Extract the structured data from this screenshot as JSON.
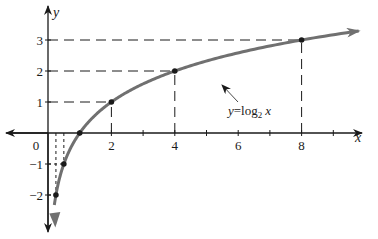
{
  "chart_data": {
    "type": "line",
    "title": "",
    "xlabel": "x",
    "ylabel": "y",
    "function": "y = log2 x",
    "annotation": {
      "text_y": "y",
      "text_eq": "=log",
      "text_sub": "2",
      "text_x": "x"
    },
    "x_ticks": [
      1,
      2,
      3,
      4,
      5,
      6,
      7,
      8,
      9
    ],
    "x_tick_labels": [
      "0",
      "2",
      "4",
      "6",
      "8"
    ],
    "y_tick_labels": [
      "3",
      "2",
      "1",
      "−1",
      "−2"
    ],
    "xlim": [
      -1.5,
      9.8
    ],
    "ylim": [
      -2.8,
      3.3
    ],
    "grid": false,
    "marked_points": [
      {
        "x": 0.25,
        "y": -2
      },
      {
        "x": 0.5,
        "y": -1
      },
      {
        "x": 1,
        "y": 0
      },
      {
        "x": 2,
        "y": 1
      },
      {
        "x": 4,
        "y": 2
      },
      {
        "x": 8,
        "y": 3
      }
    ],
    "series": [
      {
        "name": "y = log2 x",
        "x": [
          0.2,
          0.25,
          0.5,
          1,
          2,
          4,
          8,
          9.8
        ],
        "values": [
          -2.32,
          -2,
          -1,
          0,
          1,
          2,
          3,
          3.29
        ]
      }
    ],
    "colors": {
      "curve": "#707070",
      "axis": "#1a1a1a",
      "dash": "#1a1a1a"
    }
  }
}
